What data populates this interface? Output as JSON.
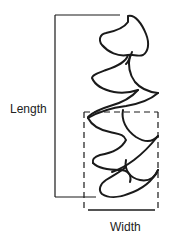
{
  "diagram": {
    "labels": {
      "length": "Length",
      "width": "Width"
    },
    "colors": {
      "stroke": "#1a1a1a",
      "text": "#222222",
      "background": "#ffffff"
    },
    "elements": [
      "length-bracket",
      "width-bracket",
      "dashed-bounding-box",
      "wavy-leaf-outline"
    ]
  }
}
